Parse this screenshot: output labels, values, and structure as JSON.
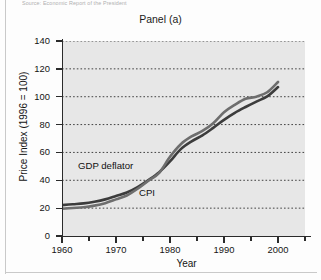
{
  "page": {
    "caption_sliver": "Source: Economic Report of the President"
  },
  "chart_data": {
    "type": "line",
    "title": "Panel (a)",
    "xlabel": "Year",
    "ylabel": "Price Index (1996 = 100)",
    "xlim": [
      1960,
      2005
    ],
    "ylim": [
      0,
      140
    ],
    "xticks": [
      1960,
      1970,
      1980,
      1990,
      2000
    ],
    "xticks_minor": [
      1965,
      1975,
      1985,
      1995,
      2005
    ],
    "yticks": [
      0,
      20,
      40,
      60,
      80,
      100,
      120,
      140
    ],
    "grid": "horizontal-dotted",
    "legend": "inline-labels",
    "x": [
      1960,
      1962,
      1964,
      1966,
      1968,
      1970,
      1972,
      1974,
      1976,
      1978,
      1980,
      1982,
      1984,
      1986,
      1988,
      1990,
      1992,
      1994,
      1996,
      1998,
      2000
    ],
    "series": [
      {
        "name": "GDP deflator",
        "color": "#3c3c3c",
        "values": [
          22.2,
          22.8,
          23.4,
          24.6,
          26.3,
          28.7,
          31.2,
          35.1,
          40.1,
          45.8,
          53.5,
          62.4,
          68.0,
          72.2,
          77.6,
          83.4,
          88.4,
          92.6,
          96.5,
          100.2,
          106.9
        ]
      },
      {
        "name": "CPI",
        "color": "#6e6e6e",
        "values": [
          19.6,
          20.1,
          20.6,
          21.8,
          23.6,
          26.3,
          29.1,
          33.9,
          39.7,
          45.4,
          56.9,
          65.9,
          71.5,
          75.4,
          81.0,
          88.9,
          94.2,
          98.5,
          100.0,
          103.2,
          110.6
        ]
      }
    ],
    "annotations": [
      {
        "text": "GDP deflator"
      },
      {
        "text": "CPI"
      }
    ]
  }
}
